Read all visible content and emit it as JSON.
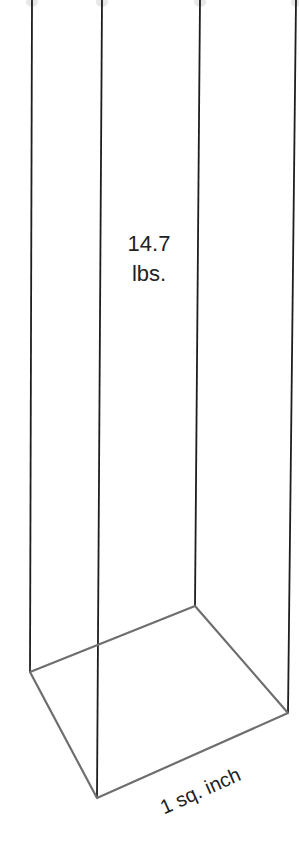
{
  "diagram": {
    "type": "3d-column",
    "column_label_line1": "14.7",
    "column_label_line2": "lbs.",
    "base_label": "1 sq. inch",
    "colors": {
      "vertical_edges": "#1e1e1e",
      "base_edges": "#6e6e6e",
      "background": "#ffffff"
    }
  }
}
